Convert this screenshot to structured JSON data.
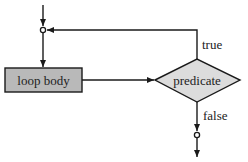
{
  "diagram": {
    "type": "flowchart",
    "title": "",
    "nodes": [
      {
        "id": "loop_body",
        "shape": "rectangle",
        "label": "loop body",
        "fill": "#b9b9b9"
      },
      {
        "id": "predicate",
        "shape": "diamond",
        "label": "predicate",
        "fill": "#dcdcdc"
      },
      {
        "id": "entry_junction",
        "shape": "small-circle",
        "label": ""
      },
      {
        "id": "exit_junction",
        "shape": "small-circle",
        "label": ""
      }
    ],
    "edges": [
      {
        "from": "entry",
        "to": "entry_junction",
        "label": ""
      },
      {
        "from": "entry_junction",
        "to": "loop_body",
        "label": ""
      },
      {
        "from": "loop_body",
        "to": "predicate",
        "label": ""
      },
      {
        "from": "predicate",
        "to": "entry_junction",
        "label": "true"
      },
      {
        "from": "predicate",
        "to": "exit_junction",
        "label": "false"
      },
      {
        "from": "exit_junction",
        "to": "exit",
        "label": ""
      }
    ],
    "labels": {
      "loop_body": "loop body",
      "predicate": "predicate",
      "true_branch": "true",
      "false_branch": "false"
    },
    "colors": {
      "stroke": "#1a1a1a",
      "box_fill": "#b9b9b9",
      "diamond_fill": "#dcdcdc",
      "background": "#ffffff"
    }
  }
}
